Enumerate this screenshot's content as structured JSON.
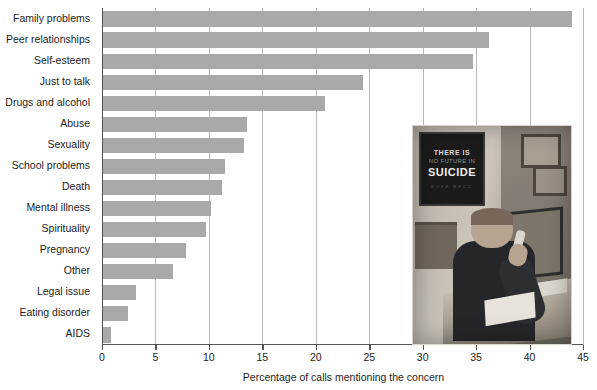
{
  "chart_data": {
    "type": "bar",
    "orientation": "horizontal",
    "title": "",
    "xlabel": "Percentage of calls mentioning the concern",
    "ylabel": "",
    "xlim": [
      0,
      45
    ],
    "xticks": [
      0,
      5,
      10,
      15,
      20,
      25,
      30,
      35,
      40,
      45
    ],
    "grid": "vertical",
    "legend": "none",
    "bar_color": "#a9a9a9",
    "categories": [
      "Family problems",
      "Peer relationships",
      "Self-esteem",
      "Just to talk",
      "Drugs and alcohol",
      "Abuse",
      "Sexuality",
      "School problems",
      "Death",
      "Mental illness",
      "Spirituality",
      "Pregnancy",
      "Other",
      "Legal issue",
      "Eating disorder",
      "AIDS"
    ],
    "values": [
      44.0,
      36.2,
      34.7,
      24.4,
      20.9,
      13.6,
      13.3,
      11.5,
      11.2,
      10.2,
      9.7,
      7.9,
      6.6,
      3.2,
      2.4,
      0.8
    ]
  },
  "axis": {
    "x_title": "Percentage of calls mentioning the concern",
    "tick_labels": [
      "0",
      "5",
      "10",
      "15",
      "20",
      "25",
      "30",
      "35",
      "40",
      "45"
    ]
  },
  "photo": {
    "caption_alt": "Man seated at a desk answering a telephone at a crisis hotline office",
    "poster_line1": "THERE IS",
    "poster_line2": "NO FUTURE IN",
    "poster_line3": "SUICIDE",
    "poster_line4": "KOFF    MPCC"
  }
}
